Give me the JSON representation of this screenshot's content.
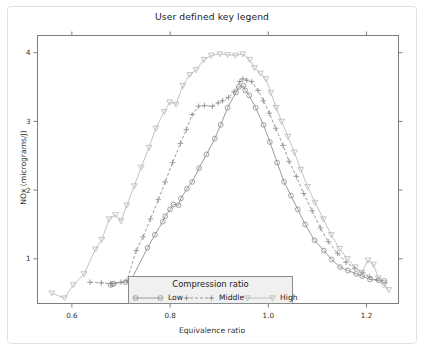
{
  "chart_data": {
    "type": "line",
    "title": "User defined key legend",
    "xlabel": "Equivalence ratio",
    "ylabel": "NOx (micrograms/J)",
    "xlim": [
      0.53,
      1.265
    ],
    "ylim": [
      0.35,
      4.25
    ],
    "xticks": [
      0.6,
      0.8,
      1.0,
      1.2
    ],
    "xtick_labels": [
      "0.6",
      "0.8",
      "1.0",
      "1.2"
    ],
    "yticks": [
      1,
      2,
      3,
      4
    ],
    "ytick_labels": [
      "1",
      "2",
      "3",
      "4"
    ],
    "grid": false,
    "legend_position": "bottom-center-inside",
    "legend_title": "Compression ratio",
    "series": [
      {
        "name": "Low",
        "marker": "circle",
        "linestyle": "solid",
        "color": "#8a8a8a",
        "points": [
          [
            0.679,
            0.62
          ],
          [
            0.683,
            0.63
          ],
          [
            0.685,
            0.64
          ],
          [
            0.709,
            0.66
          ],
          [
            0.72,
            0.68
          ],
          [
            0.754,
            1.16
          ],
          [
            0.769,
            1.35
          ],
          [
            0.785,
            1.54
          ],
          [
            0.79,
            1.62
          ],
          [
            0.8,
            1.72
          ],
          [
            0.807,
            1.79
          ],
          [
            0.817,
            1.78
          ],
          [
            0.822,
            1.88
          ],
          [
            0.834,
            2.02
          ],
          [
            0.845,
            2.12
          ],
          [
            0.859,
            2.32
          ],
          [
            0.874,
            2.52
          ],
          [
            0.891,
            2.75
          ],
          [
            0.903,
            2.95
          ],
          [
            0.917,
            3.2
          ],
          [
            0.934,
            3.42
          ],
          [
            0.94,
            3.5
          ],
          [
            0.949,
            3.52
          ],
          [
            0.953,
            3.45
          ],
          [
            0.961,
            3.38
          ],
          [
            0.974,
            3.2
          ],
          [
            0.99,
            2.95
          ],
          [
            1.003,
            2.7
          ],
          [
            1.018,
            2.4
          ],
          [
            1.032,
            2.12
          ],
          [
            1.046,
            1.92
          ],
          [
            1.06,
            1.72
          ],
          [
            1.075,
            1.5
          ],
          [
            1.094,
            1.27
          ],
          [
            1.113,
            1.12
          ],
          [
            1.129,
            0.99
          ],
          [
            1.146,
            0.88
          ],
          [
            1.162,
            0.83
          ],
          [
            1.179,
            0.78
          ],
          [
            1.191,
            0.75
          ],
          [
            1.207,
            0.7
          ],
          [
            1.225,
            0.69
          ],
          [
            1.236,
            0.68
          ]
        ]
      },
      {
        "name": "Middle",
        "marker": "plus",
        "linestyle": "dashed",
        "color": "#8a8a8a",
        "points": [
          [
            0.637,
            0.66
          ],
          [
            0.66,
            0.65
          ],
          [
            0.679,
            0.64
          ],
          [
            0.7,
            0.66
          ],
          [
            0.712,
            0.68
          ],
          [
            0.731,
            1.12
          ],
          [
            0.745,
            1.32
          ],
          [
            0.76,
            1.58
          ],
          [
            0.776,
            1.86
          ],
          [
            0.79,
            2.12
          ],
          [
            0.805,
            2.4
          ],
          [
            0.821,
            2.68
          ],
          [
            0.833,
            2.88
          ],
          [
            0.845,
            3.1
          ],
          [
            0.858,
            3.22
          ],
          [
            0.87,
            3.23
          ],
          [
            0.886,
            3.22
          ],
          [
            0.898,
            3.27
          ],
          [
            0.907,
            3.3
          ],
          [
            0.919,
            3.35
          ],
          [
            0.93,
            3.43
          ],
          [
            0.942,
            3.58
          ],
          [
            0.948,
            3.62
          ],
          [
            0.956,
            3.6
          ],
          [
            0.966,
            3.58
          ],
          [
            0.979,
            3.45
          ],
          [
            0.99,
            3.3
          ],
          [
            1.002,
            3.12
          ],
          [
            1.015,
            2.9
          ],
          [
            1.03,
            2.65
          ],
          [
            1.042,
            2.42
          ],
          [
            1.057,
            2.2
          ],
          [
            1.072,
            1.95
          ],
          [
            1.089,
            1.7
          ],
          [
            1.106,
            1.45
          ],
          [
            1.122,
            1.25
          ],
          [
            1.141,
            1.08
          ],
          [
            1.158,
            0.95
          ],
          [
            1.176,
            0.86
          ],
          [
            1.192,
            0.8
          ],
          [
            1.206,
            0.74
          ],
          [
            1.222,
            0.69
          ],
          [
            1.238,
            0.65
          ]
        ]
      },
      {
        "name": "High",
        "marker": "triangle-down",
        "linestyle": "solid",
        "color": "#b8b8b8",
        "points": [
          [
            0.559,
            0.5
          ],
          [
            0.585,
            0.43
          ],
          [
            0.603,
            0.62
          ],
          [
            0.625,
            0.78
          ],
          [
            0.648,
            1.14
          ],
          [
            0.661,
            1.28
          ],
          [
            0.676,
            1.58
          ],
          [
            0.689,
            1.64
          ],
          [
            0.7,
            1.55
          ],
          [
            0.712,
            1.78
          ],
          [
            0.727,
            2.06
          ],
          [
            0.741,
            2.33
          ],
          [
            0.757,
            2.62
          ],
          [
            0.771,
            2.9
          ],
          [
            0.788,
            3.14
          ],
          [
            0.799,
            3.28
          ],
          [
            0.812,
            3.25
          ],
          [
            0.826,
            3.52
          ],
          [
            0.84,
            3.68
          ],
          [
            0.853,
            3.75
          ],
          [
            0.869,
            3.9
          ],
          [
            0.884,
            3.96
          ],
          [
            0.901,
            3.98
          ],
          [
            0.917,
            3.97
          ],
          [
            0.933,
            3.96
          ],
          [
            0.948,
            3.98
          ],
          [
            0.962,
            3.9
          ],
          [
            0.972,
            3.78
          ],
          [
            0.984,
            3.7
          ],
          [
            0.995,
            3.62
          ],
          [
            1.005,
            3.42
          ],
          [
            1.016,
            3.2
          ],
          [
            1.027,
            3.0
          ],
          [
            1.04,
            2.78
          ],
          [
            1.053,
            2.55
          ],
          [
            1.066,
            2.3
          ],
          [
            1.08,
            2.05
          ],
          [
            1.095,
            1.82
          ],
          [
            1.112,
            1.58
          ],
          [
            1.128,
            1.35
          ],
          [
            1.145,
            1.15
          ],
          [
            1.161,
            1.0
          ],
          [
            1.177,
            0.88
          ],
          [
            1.19,
            0.8
          ],
          [
            1.203,
            0.98
          ],
          [
            1.214,
            0.92
          ],
          [
            1.224,
            0.72
          ],
          [
            1.235,
            0.62
          ],
          [
            1.245,
            0.55
          ]
        ]
      }
    ]
  },
  "legend": {
    "title": "Compression ratio",
    "entries": [
      {
        "label": "Low",
        "marker": "circle",
        "linestyle": "solid"
      },
      {
        "label": "Middle",
        "marker": "plus",
        "linestyle": "dashed"
      },
      {
        "label": "High",
        "marker": "triangle-down",
        "linestyle": "solid"
      }
    ]
  },
  "colors": {
    "axis": "#7d7d7d",
    "text": "#1a1a1a",
    "low": "#8a8a8a",
    "middle": "#8a8a8a",
    "high": "#b8b8b8",
    "legend_bg": "#f0f0f0",
    "legend_border": "#8a8a8a",
    "frame": "#e2e2e2"
  }
}
